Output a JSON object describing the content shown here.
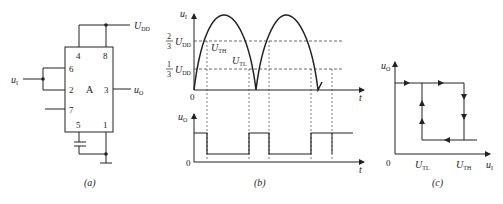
{
  "panel_a": {
    "caption": "(a)",
    "chip_label": "A",
    "pins": {
      "p4": "4",
      "p8": "8",
      "p6": "6",
      "p2": "2",
      "p3": "3",
      "p7": "7",
      "p5": "5",
      "p1": "1"
    },
    "supply": "U",
    "supply_sub": "DD",
    "input": "u",
    "input_sub": "I",
    "output": "u",
    "output_sub": "O"
  },
  "panel_b": {
    "caption": "(b)",
    "top_ylabel": "u",
    "top_ylabel_sub": "I",
    "bottom_ylabel": "u",
    "bottom_ylabel_sub": "O",
    "xlabel": "t",
    "origin": "0",
    "level_high_num": "2",
    "level_high_den": "3",
    "level_low_num": "1",
    "level_low_den": "3",
    "level_U": "U",
    "level_sub": "DD",
    "uth": "U",
    "uth_sub": "TH",
    "utl": "U",
    "utl_sub": "TL"
  },
  "panel_c": {
    "caption": "(c)",
    "ylabel": "u",
    "ylabel_sub": "O",
    "xlabel": "u",
    "xlabel_sub": "I",
    "origin": "0",
    "tick1": "U",
    "tick1_sub": "TL",
    "tick2": "U",
    "tick2_sub": "TH"
  }
}
